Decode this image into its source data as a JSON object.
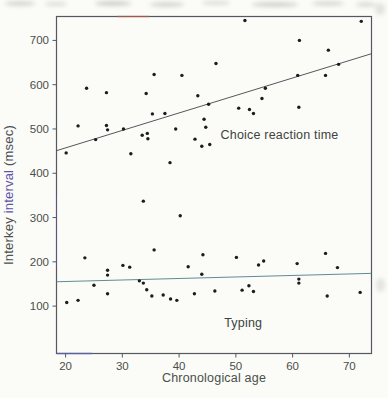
{
  "figure": {
    "background": "#fbfbf8",
    "border_color": "#55585e",
    "point_color": "#1c1c1c",
    "tick_label_color": "#4a5049",
    "axis_label_color": "#4a5049",
    "annotation_color": "#3d4440",
    "artifact_red": "#a8584a",
    "artifact_blue": "#5b64b0",
    "artifact_purple": "#6158a5"
  },
  "chart_data": {
    "type": "scatter",
    "title": "",
    "xlabel": "Chronological age",
    "ylabel": "Interkey interval (msec)",
    "ylabel_parts": [
      {
        "text": "Interkey ",
        "color": "#4b514c"
      },
      {
        "text": "interval",
        "color": "#5d55a8"
      },
      {
        "text": " (msec)",
        "color": "#4b4f55"
      }
    ],
    "xlim": [
      18.4,
      73.9
    ],
    "ylim": [
      -7,
      754
    ],
    "x_ticks": [
      20,
      30,
      40,
      50,
      60,
      70
    ],
    "y_ticks": [
      100,
      200,
      300,
      400,
      500,
      600,
      700
    ],
    "grid": false,
    "legend": "inline-annotations",
    "series": [
      {
        "name": "Choice reaction time",
        "line_color": "#41454b",
        "fit_line": {
          "x1": 18.4,
          "y1": 451,
          "x2": 73.9,
          "y2": 670
        },
        "points": [
          [
            20.1,
            446
          ],
          [
            22.2,
            507
          ],
          [
            23.7,
            592
          ],
          [
            25.3,
            476
          ],
          [
            27.2,
            582
          ],
          [
            27.2,
            508
          ],
          [
            27.4,
            498
          ],
          [
            30.2,
            500
          ],
          [
            31.5,
            444
          ],
          [
            33.5,
            486
          ],
          [
            34.2,
            580
          ],
          [
            34.4,
            490
          ],
          [
            34.5,
            478
          ],
          [
            35.3,
            534
          ],
          [
            35.6,
            623
          ],
          [
            37.5,
            535
          ],
          [
            38.4,
            424
          ],
          [
            39.4,
            500
          ],
          [
            40.5,
            621
          ],
          [
            42.8,
            477
          ],
          [
            43.3,
            575
          ],
          [
            44.0,
            461
          ],
          [
            44.4,
            522
          ],
          [
            44.7,
            504
          ],
          [
            45.2,
            556
          ],
          [
            45.4,
            465
          ],
          [
            46.5,
            648
          ],
          [
            50.5,
            547
          ],
          [
            51.6,
            745
          ],
          [
            52.4,
            544
          ],
          [
            53.1,
            535
          ],
          [
            54.6,
            569
          ],
          [
            55.2,
            592
          ],
          [
            60.9,
            621
          ],
          [
            61.1,
            549
          ],
          [
            61.2,
            700
          ],
          [
            65.8,
            621
          ],
          [
            66.3,
            678
          ],
          [
            68.1,
            646
          ],
          [
            72.1,
            743
          ]
        ]
      },
      {
        "name": "Typing",
        "line_color": "#507e8c",
        "fit_line": {
          "x1": 18.4,
          "y1": 155,
          "x2": 73.9,
          "y2": 174
        },
        "points": [
          [
            20.2,
            108
          ],
          [
            22.2,
            113
          ],
          [
            23.4,
            209
          ],
          [
            25.0,
            147
          ],
          [
            27.4,
            181
          ],
          [
            27.4,
            170
          ],
          [
            27.4,
            128
          ],
          [
            30.1,
            192
          ],
          [
            31.3,
            188
          ],
          [
            33.0,
            157
          ],
          [
            33.7,
            152
          ],
          [
            33.7,
            337
          ],
          [
            34.3,
            137
          ],
          [
            35.2,
            123
          ],
          [
            35.6,
            227
          ],
          [
            37.2,
            125
          ],
          [
            38.5,
            116
          ],
          [
            39.6,
            113
          ],
          [
            40.2,
            304
          ],
          [
            41.6,
            189
          ],
          [
            42.7,
            128
          ],
          [
            44.0,
            172
          ],
          [
            44.2,
            216
          ],
          [
            46.3,
            134
          ],
          [
            50.1,
            210
          ],
          [
            51.1,
            136
          ],
          [
            52.3,
            146
          ],
          [
            53.1,
            133
          ],
          [
            54.0,
            193
          ],
          [
            54.9,
            202
          ],
          [
            60.8,
            196
          ],
          [
            61.1,
            161
          ],
          [
            61.1,
            152
          ],
          [
            65.8,
            219
          ],
          [
            66.1,
            123
          ],
          [
            67.9,
            187
          ],
          [
            71.9,
            131
          ]
        ]
      }
    ],
    "annotations": [
      {
        "text": "Choice reaction time",
        "x": 57.7,
        "y": 487,
        "series": "choice-reaction-time"
      },
      {
        "text": "Typing",
        "x": 51.3,
        "y": 63,
        "series": "typing"
      }
    ]
  }
}
